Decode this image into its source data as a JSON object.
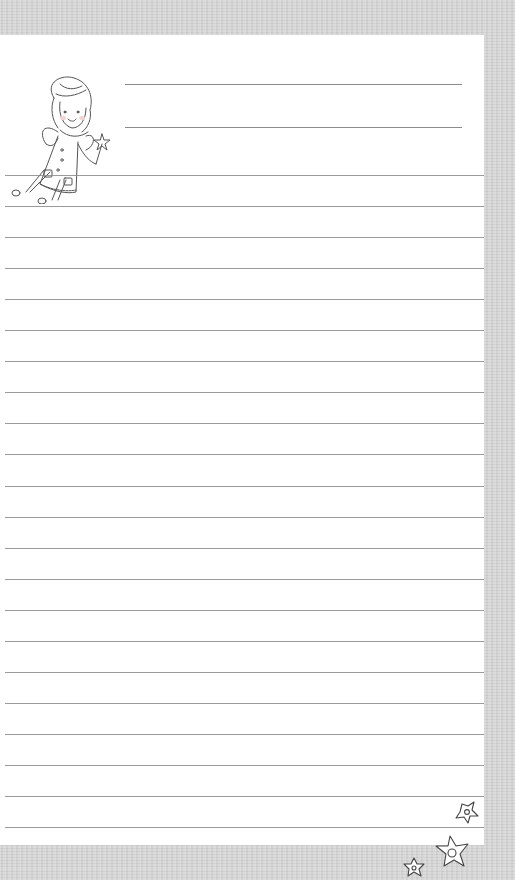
{
  "page": {
    "type": "lined-stationery",
    "background_color": "#d6d6d6",
    "paper_color": "#ffffff",
    "rule_color": "#8a8a8a"
  },
  "header": {
    "illustration": "fairy-with-wand",
    "name_lines": 2
  },
  "body": {
    "ruled_lines": 22,
    "line_spacing_px": 31
  },
  "footer": {
    "decoration": "three-stars"
  }
}
